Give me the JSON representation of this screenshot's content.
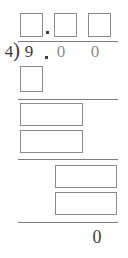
{
  "problem": {
    "type": "long-division",
    "divisor": "4",
    "dividend": "9.00",
    "bracket_glyph": ")",
    "dividend_digits": [
      "9",
      ".",
      "0",
      "0"
    ],
    "remainder": "0",
    "decimal_point": "."
  },
  "quotient": {
    "boxes": [
      {
        "value": "",
        "placeholder": ""
      },
      {
        "value": "",
        "placeholder": ""
      },
      {
        "value": "",
        "placeholder": ""
      }
    ],
    "decimal_point": "."
  },
  "work": {
    "step1": {
      "boxes": [
        {
          "value": "",
          "placeholder": ""
        }
      ]
    },
    "step2": {
      "boxes": [
        {
          "value": "",
          "placeholder": ""
        },
        {
          "value": "",
          "placeholder": ""
        }
      ]
    },
    "step3": {
      "boxes": [
        {
          "value": "",
          "placeholder": ""
        },
        {
          "value": "",
          "placeholder": ""
        }
      ]
    }
  },
  "colors": {
    "box_border": "#8a8a8a",
    "rule": "#7d7d7d",
    "ink": "#3b3b3b",
    "faint_ink": "#8d8d8d",
    "page": "#ffffff"
  }
}
